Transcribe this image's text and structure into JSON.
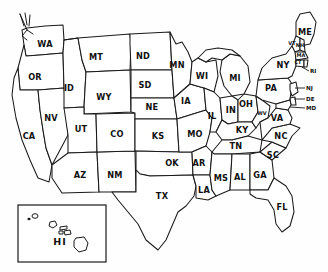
{
  "map": {
    "title": "United States state abbreviation map",
    "style": "hand-drawn outline",
    "background_color": "#ffffff",
    "line_color": "#1a1a1a",
    "label_color": "#111111",
    "states": [
      {
        "abbr": "WA",
        "name": "Washington",
        "x": 45,
        "y": 44
      },
      {
        "abbr": "OR",
        "name": "Oregon",
        "x": 35,
        "y": 77
      },
      {
        "abbr": "CA",
        "name": "California",
        "x": 29,
        "y": 136
      },
      {
        "abbr": "NV",
        "name": "Nevada",
        "x": 51,
        "y": 118
      },
      {
        "abbr": "ID",
        "name": "Idaho",
        "x": 69,
        "y": 88
      },
      {
        "abbr": "MT",
        "name": "Montana",
        "x": 96,
        "y": 57
      },
      {
        "abbr": "WY",
        "name": "Wyoming",
        "x": 104,
        "y": 97
      },
      {
        "abbr": "UT",
        "name": "Utah",
        "x": 81,
        "y": 129
      },
      {
        "abbr": "AZ",
        "name": "Arizona",
        "x": 80,
        "y": 175
      },
      {
        "abbr": "NM",
        "name": "New Mexico",
        "x": 115,
        "y": 175
      },
      {
        "abbr": "CO",
        "name": "Colorado",
        "x": 117,
        "y": 134
      },
      {
        "abbr": "ND",
        "name": "North Dakota",
        "x": 143,
        "y": 56
      },
      {
        "abbr": "SD",
        "name": "South Dakota",
        "x": 145,
        "y": 85
      },
      {
        "abbr": "NE",
        "name": "Nebraska",
        "x": 152,
        "y": 107
      },
      {
        "abbr": "KS",
        "name": "Kansas",
        "x": 158,
        "y": 136
      },
      {
        "abbr": "OK",
        "name": "Oklahoma",
        "x": 172,
        "y": 163
      },
      {
        "abbr": "TX",
        "name": "Texas",
        "x": 162,
        "y": 196
      },
      {
        "abbr": "MN",
        "name": "Minnesota",
        "x": 177,
        "y": 65
      },
      {
        "abbr": "IA",
        "name": "Iowa",
        "x": 186,
        "y": 101
      },
      {
        "abbr": "MO",
        "name": "Missouri",
        "x": 195,
        "y": 134
      },
      {
        "abbr": "AR",
        "name": "Arkansas",
        "x": 199,
        "y": 163
      },
      {
        "abbr": "LA",
        "name": "Louisiana",
        "x": 204,
        "y": 190
      },
      {
        "abbr": "WI",
        "name": "Wisconsin",
        "x": 202,
        "y": 76
      },
      {
        "abbr": "IL",
        "name": "Illinois",
        "x": 212,
        "y": 116
      },
      {
        "abbr": "MS",
        "name": "Mississippi",
        "x": 221,
        "y": 178
      },
      {
        "abbr": "MI",
        "name": "Michigan",
        "x": 235,
        "y": 78
      },
      {
        "abbr": "IN",
        "name": "Indiana",
        "x": 231,
        "y": 110
      },
      {
        "abbr": "KY",
        "name": "Kentucky",
        "x": 242,
        "y": 130
      },
      {
        "abbr": "TN",
        "name": "Tennessee",
        "x": 236,
        "y": 146
      },
      {
        "abbr": "AL",
        "name": "Alabama",
        "x": 240,
        "y": 177
      },
      {
        "abbr": "OH",
        "name": "Ohio",
        "x": 246,
        "y": 104
      },
      {
        "abbr": "GA",
        "name": "Georgia",
        "x": 260,
        "y": 175
      },
      {
        "abbr": "SC",
        "name": "South Carolina",
        "x": 273,
        "y": 155
      },
      {
        "abbr": "NC",
        "name": "North Carolina",
        "x": 281,
        "y": 136
      },
      {
        "abbr": "WV",
        "name": "West Virginia",
        "x": 262,
        "y": 114
      },
      {
        "abbr": "VA",
        "name": "Virginia",
        "x": 277,
        "y": 118
      },
      {
        "abbr": "PA",
        "name": "Pennsylvania",
        "x": 271,
        "y": 88
      },
      {
        "abbr": "NY",
        "name": "New York",
        "x": 283,
        "y": 65
      },
      {
        "abbr": "ME",
        "name": "Maine",
        "x": 305,
        "y": 32
      },
      {
        "abbr": "FL",
        "name": "Florida",
        "x": 282,
        "y": 207
      }
    ],
    "small_states": [
      {
        "abbr": "VT",
        "name": "Vermont",
        "x": 292,
        "y": 44
      },
      {
        "abbr": "NH",
        "name": "New Hampshire",
        "x": 299,
        "y": 47
      },
      {
        "abbr": "MA",
        "name": "Massachusetts",
        "x": 301,
        "y": 55
      },
      {
        "abbr": "CT",
        "name": "Connecticut",
        "x": 298,
        "y": 62
      }
    ],
    "callout_labels": [
      {
        "abbr": "RI",
        "name": "Rhode Island",
        "label_x": 311,
        "label_y": 71,
        "leader_x1": 309,
        "leader_y1": 71,
        "leader_x2": 302,
        "leader_y2": 67
      },
      {
        "abbr": "NJ",
        "name": "New Jersey",
        "label_x": 307,
        "label_y": 88,
        "leader_x1": 305,
        "leader_y1": 88,
        "leader_x2": 295,
        "leader_y2": 88
      },
      {
        "abbr": "DE",
        "name": "Delaware",
        "label_x": 307,
        "label_y": 99,
        "leader_x1": 305,
        "leader_y1": 99,
        "leader_x2": 294,
        "leader_y2": 99
      },
      {
        "abbr": "MD",
        "name": "Maryland",
        "label_x": 307,
        "label_y": 108,
        "leader_x1": 305,
        "leader_y1": 108,
        "leader_x2": 290,
        "leader_y2": 107
      }
    ],
    "inset": {
      "label": "HI",
      "name": "Hawaii",
      "label_x": 60,
      "label_y": 242,
      "box": {
        "x": 18,
        "y": 205,
        "width": 88,
        "height": 57
      }
    }
  }
}
